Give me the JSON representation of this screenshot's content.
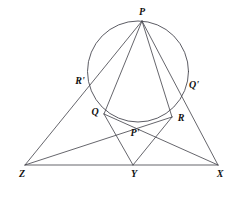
{
  "figure": {
    "width": 245,
    "height": 198,
    "background_color": "#ffffff",
    "stroke_color": "#4a4a52",
    "label_color": "#111111"
  },
  "circle": {
    "name": "circle-through-P-Q-R",
    "cx": 138,
    "cy": 71.5,
    "r": 50.5
  },
  "points": {
    "P": {
      "label": "P",
      "x": 142,
      "y": 21,
      "label_x": 142,
      "label_y": 12
    },
    "R_prime": {
      "label": "R'",
      "x": 93,
      "y": 88,
      "label_x": 80,
      "label_y": 81
    },
    "Q_prime": {
      "label": "Q'",
      "x": 181,
      "y": 91,
      "label_x": 194,
      "label_y": 85
    },
    "Q": {
      "label": "Q",
      "x": 104,
      "y": 114,
      "label_x": 95,
      "label_y": 112
    },
    "R": {
      "label": "R",
      "x": 172,
      "y": 117,
      "label_x": 181,
      "label_y": 118
    },
    "P_prime": {
      "label": "P'",
      "x": 136,
      "y": 126,
      "label_x": 135,
      "label_y": 133
    },
    "Z": {
      "label": "Z",
      "x": 25,
      "y": 165,
      "label_x": 22,
      "label_y": 174
    },
    "Y": {
      "label": "Y",
      "x": 133,
      "y": 165,
      "label_x": 134,
      "label_y": 174
    },
    "X": {
      "label": "X",
      "x": 218,
      "y": 165,
      "label_x": 220,
      "label_y": 174
    }
  },
  "segments": [
    {
      "name": "segment-P-Z",
      "from": "P",
      "to": "Z",
      "through": "R'"
    },
    {
      "name": "segment-P-X",
      "from": "P",
      "to": "X",
      "through": "Q'"
    },
    {
      "name": "segment-Z-X",
      "from": "Z",
      "to": "X",
      "through": "Y"
    },
    {
      "name": "segment-Z-R",
      "from": "Z",
      "to": "R",
      "through": "P'"
    },
    {
      "name": "segment-X-Q",
      "from": "X",
      "to": "Q",
      "through": "P'"
    },
    {
      "name": "segment-Y-Q",
      "from": "Y",
      "to": "Q",
      "through": ""
    },
    {
      "name": "segment-Y-R",
      "from": "Y",
      "to": "R",
      "through": ""
    },
    {
      "name": "segment-P-Q",
      "from": "P",
      "to": "Q",
      "through": "R'"
    },
    {
      "name": "segment-P-R",
      "from": "P",
      "to": "R",
      "through": "Q'"
    }
  ],
  "arcs": [
    {
      "name": "arc-Q-to-Pprime",
      "from": "Q",
      "to": "P'"
    },
    {
      "name": "arc-Pprime-to-R",
      "from": "P'",
      "to": "R"
    }
  ]
}
